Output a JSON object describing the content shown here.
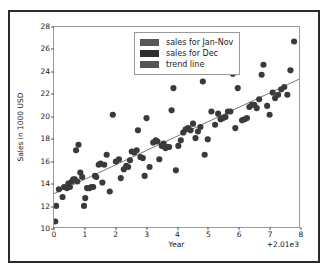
{
  "figure": {
    "background": "#ffffff",
    "frame_color": "#2b2b2b"
  },
  "chart_data": {
    "type": "scatter",
    "title": "",
    "xlabel": "Year",
    "ylabel": "Sales in 1000 USD",
    "xlim": [
      0,
      8
    ],
    "ylim": [
      10,
      28
    ],
    "x_offset_text": "+2.01e3",
    "grid": false,
    "legend_position": "upper center",
    "xticks": [
      0,
      1,
      2,
      3,
      4,
      5,
      6,
      7,
      8
    ],
    "xticklabels": [
      "0",
      "1",
      "2",
      "3",
      "4",
      "5",
      "6",
      "7",
      "8"
    ],
    "yticks": [
      10,
      12,
      14,
      16,
      18,
      20,
      22,
      24,
      26,
      28
    ],
    "yticklabels": [
      "10",
      "12",
      "14",
      "16",
      "18",
      "20",
      "22",
      "24",
      "26",
      "28"
    ],
    "marker_color": "#3a3a3a",
    "marker_size": 3.1,
    "trend_color": "#555555",
    "series": [
      {
        "name": "sales for Jan-Nov",
        "color": "#3a3a3a",
        "points": [
          [
            0.04,
            10.5
          ],
          [
            0.07,
            11.9
          ],
          [
            0.16,
            13.4
          ],
          [
            0.28,
            12.7
          ],
          [
            0.33,
            13.6
          ],
          [
            0.42,
            13.5
          ],
          [
            0.47,
            13.9
          ],
          [
            0.52,
            13.6
          ],
          [
            0.58,
            14.1
          ],
          [
            0.63,
            14.3
          ],
          [
            0.68,
            14.3
          ],
          [
            0.72,
            16.9
          ],
          [
            0.76,
            14.1
          ],
          [
            0.8,
            17.4
          ],
          [
            0.86,
            14.9
          ],
          [
            0.92,
            14.5
          ],
          [
            0.98,
            11.9
          ],
          [
            1.02,
            12.6
          ],
          [
            1.08,
            13.5
          ],
          [
            1.16,
            13.5
          ],
          [
            1.22,
            13.6
          ],
          [
            1.28,
            13.6
          ],
          [
            1.34,
            14.6
          ],
          [
            1.38,
            14.5
          ],
          [
            1.46,
            15.6
          ],
          [
            1.52,
            15.7
          ],
          [
            1.58,
            14.0
          ],
          [
            1.64,
            15.6
          ],
          [
            1.72,
            16.5
          ],
          [
            1.82,
            13.2
          ],
          [
            1.92,
            20.1
          ],
          [
            2.02,
            15.9
          ],
          [
            2.12,
            16.1
          ],
          [
            2.18,
            14.4
          ],
          [
            2.28,
            15.2
          ],
          [
            2.36,
            15.5
          ],
          [
            2.42,
            15.4
          ],
          [
            2.48,
            16.0
          ],
          [
            2.54,
            16.8
          ],
          [
            2.62,
            16.7
          ],
          [
            2.7,
            16.9
          ],
          [
            2.74,
            18.7
          ],
          [
            2.82,
            16.3
          ],
          [
            2.9,
            16.2
          ],
          [
            2.96,
            14.6
          ],
          [
            3.02,
            19.8
          ],
          [
            3.12,
            15.4
          ],
          [
            3.24,
            17.6
          ],
          [
            3.32,
            17.8
          ],
          [
            3.38,
            17.7
          ],
          [
            3.44,
            16.1
          ],
          [
            3.52,
            17.3
          ],
          [
            3.58,
            17.5
          ],
          [
            3.64,
            17.1
          ],
          [
            3.7,
            17.2
          ],
          [
            3.76,
            17.2
          ],
          [
            3.84,
            20.5
          ],
          [
            3.9,
            22.5
          ],
          [
            3.98,
            15.1
          ],
          [
            4.06,
            17.3
          ],
          [
            4.14,
            17.8
          ],
          [
            4.22,
            18.5
          ],
          [
            4.3,
            18.8
          ],
          [
            4.38,
            18.9
          ],
          [
            4.46,
            18.7
          ],
          [
            4.54,
            19.3
          ],
          [
            4.62,
            18.0
          ],
          [
            4.7,
            18.6
          ],
          [
            4.78,
            19.0
          ],
          [
            4.86,
            23.1
          ],
          [
            4.92,
            16.5
          ],
          [
            5.02,
            17.9
          ],
          [
            5.14,
            20.4
          ],
          [
            5.26,
            19.2
          ],
          [
            5.36,
            20.2
          ],
          [
            5.44,
            19.7
          ],
          [
            5.52,
            19.8
          ],
          [
            5.6,
            19.9
          ],
          [
            5.68,
            20.4
          ],
          [
            5.76,
            20.4
          ],
          [
            5.84,
            23.8
          ],
          [
            5.92,
            18.9
          ],
          [
            6.0,
            22.5
          ],
          [
            6.14,
            19.6
          ],
          [
            6.22,
            19.7
          ],
          [
            6.3,
            19.8
          ],
          [
            6.38,
            20.8
          ],
          [
            6.46,
            21.0
          ],
          [
            6.54,
            21.0
          ],
          [
            6.62,
            20.7
          ],
          [
            6.7,
            21.5
          ],
          [
            6.78,
            23.7
          ],
          [
            6.84,
            24.6
          ],
          [
            6.96,
            20.9
          ],
          [
            7.04,
            20.1
          ],
          [
            7.14,
            22.1
          ],
          [
            7.22,
            21.6
          ],
          [
            7.32,
            21.9
          ],
          [
            7.42,
            22.4
          ],
          [
            7.52,
            22.6
          ],
          [
            7.62,
            21.9
          ],
          [
            7.72,
            24.1
          ],
          [
            7.84,
            26.7
          ]
        ]
      },
      {
        "name": "sales for Dec",
        "color": "#2a2a2a",
        "points": []
      }
    ],
    "trend_line": {
      "name": "trend line",
      "color": "#555555",
      "x": [
        0,
        8
      ],
      "y": [
        13.0,
        23.3
      ]
    }
  },
  "legend": {
    "entries": [
      {
        "label": "sales for Jan-Nov",
        "color": "#585858"
      },
      {
        "label": "sales for Dec",
        "color": "#2e2e2e"
      },
      {
        "label": "trend line",
        "color": "#555555"
      }
    ]
  }
}
